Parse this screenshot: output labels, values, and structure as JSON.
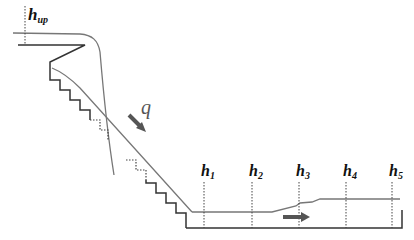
{
  "diagram": {
    "type": "stepped spillway flow profile",
    "labels": {
      "h_up": {
        "main": "h",
        "sub": "up"
      },
      "q": "q",
      "h1": {
        "main": "h",
        "sub": "1"
      },
      "h2": {
        "main": "h",
        "sub": "2"
      },
      "h3": {
        "main": "h",
        "sub": "3"
      },
      "h4": {
        "main": "h",
        "sub": "4"
      },
      "h5": {
        "main": "h",
        "sub": "5"
      }
    },
    "colors": {
      "structure": "#333333",
      "water": "#777777",
      "arrow": "#555555",
      "dotted": "#444444"
    }
  }
}
